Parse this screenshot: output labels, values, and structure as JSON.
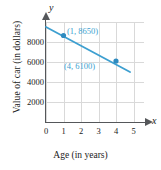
{
  "chart_data": {
    "type": "line",
    "title": "",
    "xlabel": "Age (in years)",
    "ylabel": "Value of car (in dollars)",
    "x_axis_symbol": "x",
    "y_axis_symbol": "y",
    "xlim": [
      0,
      5.6
    ],
    "ylim": [
      0,
      10000
    ],
    "xticks": [
      "0",
      "1",
      "2",
      "3",
      "4",
      "5"
    ],
    "xtick_values": [
      0,
      1,
      2,
      3,
      4,
      5
    ],
    "yticks": [
      "2000",
      "4000",
      "6000",
      "8000"
    ],
    "ytick_values": [
      2000,
      4000,
      6000,
      8000
    ],
    "grid": true,
    "legend": false,
    "series": [
      {
        "name": "Value of car",
        "line_start": {
          "x": 0,
          "y": 9500
        },
        "line_end": {
          "x": 4.8,
          "y": 5000
        },
        "points": [
          {
            "x": 1,
            "y": 8650,
            "label": "(1, 8650)"
          },
          {
            "x": 4,
            "y": 6100,
            "label": "(4, 6100)"
          }
        ]
      }
    ],
    "annotations": [
      "(1, 8650)",
      "(4, 6100)"
    ],
    "colors": {
      "line": "#3d9fd0",
      "marker": "#2e8bc0",
      "annotation_text": "#3d9fd0",
      "grid": "#d9d9d9",
      "axis": "#55575a",
      "text": "#1a1a1a"
    }
  }
}
